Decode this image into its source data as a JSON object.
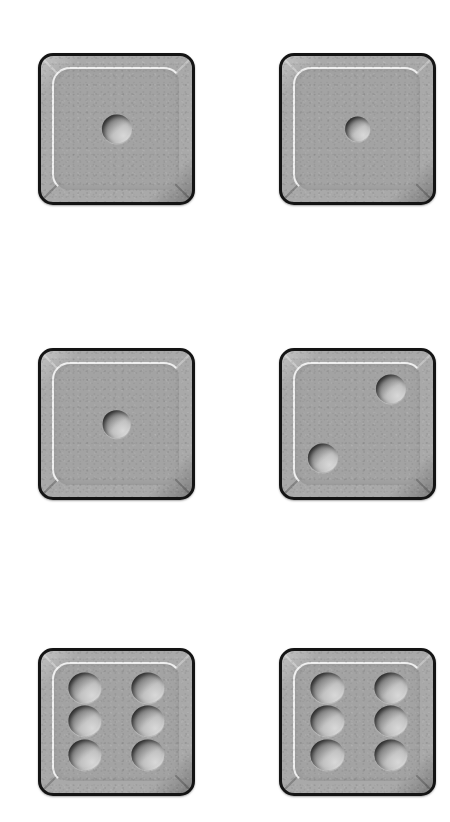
{
  "scene": {
    "title": "Six dice on white background",
    "background_color": "#ffffff",
    "width": 450,
    "height": 822,
    "columns": 2,
    "rows": 3,
    "total_dice": 6,
    "total_pips": 16
  },
  "style": {
    "die_body_color": "#a9a9a9",
    "die_face_color": "#a3a3a3",
    "die_border_color": "#141414",
    "pip_highlight_color": "#d8d8d8",
    "pip_shadow_color": "#565656",
    "inner_highlight_color": "#ffffff"
  },
  "dice": [
    {
      "id": "die-1",
      "value": 1,
      "row": 1,
      "column": 1,
      "position": {
        "x": 38,
        "y": 53,
        "width": 157,
        "height": 152
      },
      "pips": [
        {
          "cx": 50,
          "cy": 50,
          "d": 20
        }
      ]
    },
    {
      "id": "die-2",
      "value": 1,
      "row": 1,
      "column": 2,
      "position": {
        "x": 279,
        "y": 53,
        "width": 157,
        "height": 152
      },
      "pips": [
        {
          "cx": 50,
          "cy": 50,
          "d": 17
        }
      ]
    },
    {
      "id": "die-3",
      "value": 1,
      "row": 2,
      "column": 1,
      "position": {
        "x": 38,
        "y": 348,
        "width": 157,
        "height": 152
      },
      "pips": [
        {
          "cx": 50,
          "cy": 50,
          "d": 19
        }
      ]
    },
    {
      "id": "die-4",
      "value": 2,
      "row": 2,
      "column": 2,
      "position": {
        "x": 279,
        "y": 348,
        "width": 157,
        "height": 152
      },
      "pips": [
        {
          "cx": 72,
          "cy": 26,
          "d": 20
        },
        {
          "cx": 27,
          "cy": 73,
          "d": 20
        }
      ]
    },
    {
      "id": "die-5",
      "value": 6,
      "row": 3,
      "column": 1,
      "position": {
        "x": 38,
        "y": 648,
        "width": 157,
        "height": 148
      },
      "pips": [
        {
          "cx": 29,
          "cy": 26,
          "d": 22
        },
        {
          "cx": 29,
          "cy": 49,
          "d": 22
        },
        {
          "cx": 29,
          "cy": 73,
          "d": 22
        },
        {
          "cx": 71,
          "cy": 26,
          "d": 22
        },
        {
          "cx": 71,
          "cy": 49,
          "d": 22
        },
        {
          "cx": 71,
          "cy": 73,
          "d": 22
        }
      ]
    },
    {
      "id": "die-6",
      "value": 6,
      "row": 3,
      "column": 2,
      "position": {
        "x": 279,
        "y": 648,
        "width": 157,
        "height": 148
      },
      "pips": [
        {
          "cx": 30,
          "cy": 26,
          "d": 22
        },
        {
          "cx": 30,
          "cy": 49,
          "d": 22
        },
        {
          "cx": 30,
          "cy": 73,
          "d": 22
        },
        {
          "cx": 72,
          "cy": 26,
          "d": 22
        },
        {
          "cx": 72,
          "cy": 49,
          "d": 22
        },
        {
          "cx": 72,
          "cy": 73,
          "d": 22
        }
      ]
    }
  ]
}
